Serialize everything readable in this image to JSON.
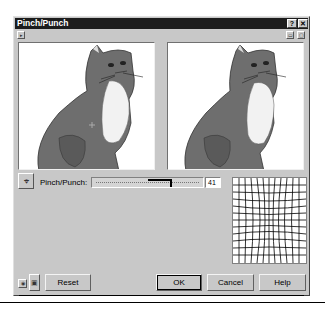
{
  "window": {
    "title": "Pinch/Punch",
    "help_button": "?",
    "close_button": "✕"
  },
  "toolbar": {
    "expand_toggle": "▸",
    "preview_mode_1": "▭",
    "preview_mode_2": "▢"
  },
  "previews": {
    "original_label": "Original preview",
    "result_label": "Result preview"
  },
  "controls": {
    "pick_center_icon": "crosshair-arrow",
    "pinch_punch_label": "Pinch/Punch:",
    "pinch_punch_value": "41",
    "slider_min": -100,
    "slider_max": 100,
    "slider_position": 41
  },
  "buttons": {
    "preview_toggle": "◉",
    "lock": "🔒",
    "reset": "Reset",
    "ok": "OK",
    "cancel": "Cancel",
    "help": "Help"
  },
  "colors": {
    "titlebar": "#1c1c1c",
    "dialog_bg": "#c8c8c8",
    "cat_body": "#6e6e6e",
    "cat_chest": "#f2f2f2"
  }
}
